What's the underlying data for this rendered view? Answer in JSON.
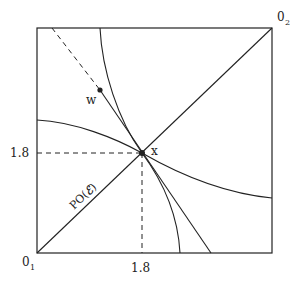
{
  "diagram": {
    "type": "edgeworth-box",
    "colors": {
      "line": "#222222",
      "background": "#ffffff"
    },
    "origins": {
      "agent1": {
        "label": "0",
        "sub": "1"
      },
      "agent2": {
        "label": "0",
        "sub": "2"
      }
    },
    "points": {
      "x": {
        "label": "x"
      },
      "w": {
        "label": "w"
      }
    },
    "ticks": {
      "x_axis": "1.8",
      "y_axis": "1.8"
    },
    "contract_curve": {
      "label_prefix": "PO(",
      "label_symbol": "ℰ",
      "label_suffix": ")"
    },
    "elements": [
      "box outline",
      "diagonal Pareto set PO(ℰ) from 0_1 to 0_2",
      "indifference curve agent 1 through x",
      "indifference curve agent 2 through x",
      "budget/price line through w and x",
      "dashed extension beyond w",
      "dashed guide lines to 1.8 on both axes"
    ]
  }
}
